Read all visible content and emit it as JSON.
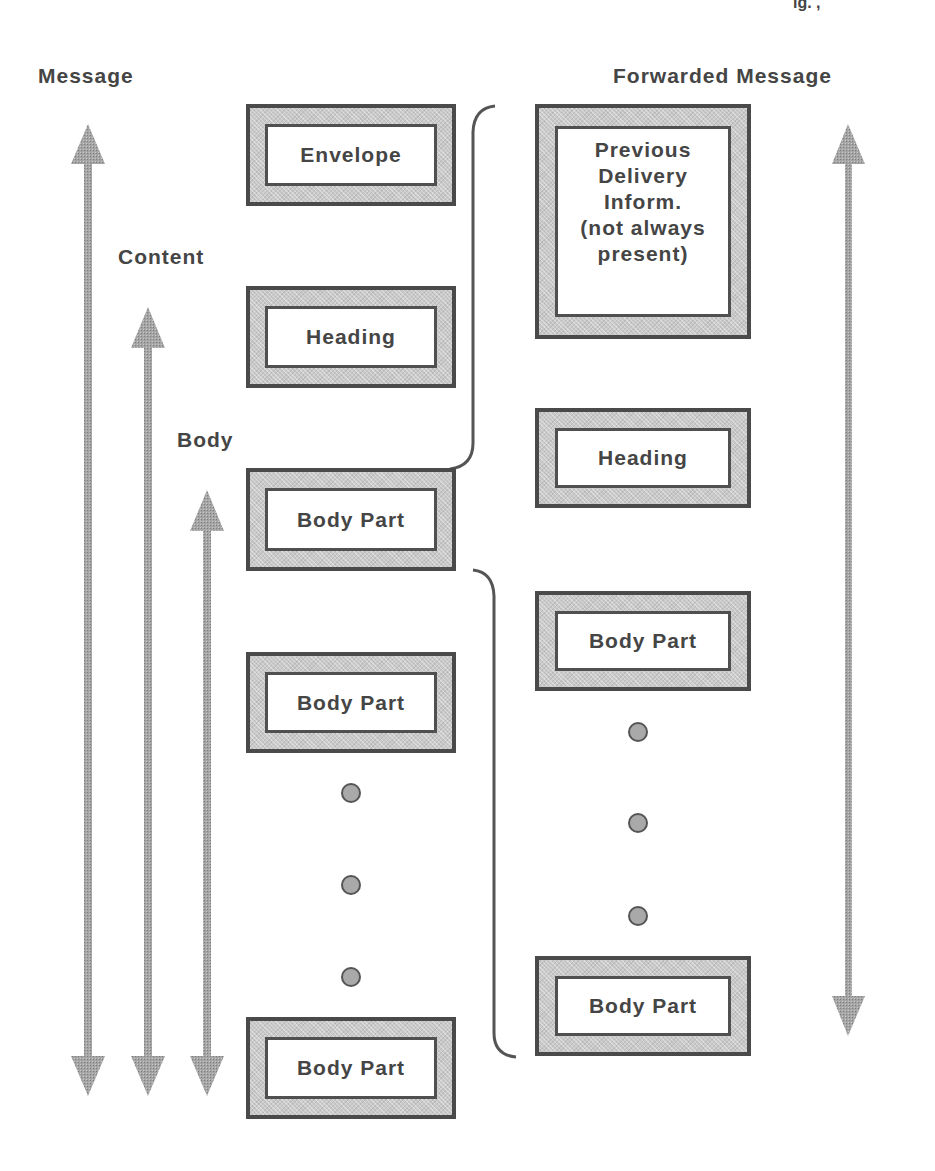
{
  "figure": {
    "top_fragment": "ig. ,",
    "left_labels": {
      "message": "Message",
      "content": "Content",
      "body": "Body"
    },
    "right_label": "Forwarded Message",
    "left_column": {
      "boxes": [
        {
          "id": "envelope",
          "label": "Envelope"
        },
        {
          "id": "heading",
          "label": "Heading"
        },
        {
          "id": "body-part-1",
          "label": "Body Part"
        },
        {
          "id": "body-part-2",
          "label": "Body Part"
        },
        {
          "id": "body-part-last",
          "label": "Body Part"
        }
      ],
      "ellipsis_dots": 3
    },
    "right_column": {
      "boxes": [
        {
          "id": "previous-delivery",
          "label": "Previous\nDelivery\nInform.\n(not always\npresent)"
        },
        {
          "id": "fwd-heading",
          "label": "Heading"
        },
        {
          "id": "fwd-body-part-1",
          "label": "Body Part"
        },
        {
          "id": "fwd-body-part-last",
          "label": "Body Part"
        }
      ],
      "ellipsis_dots": 3
    },
    "arrows": [
      {
        "id": "message-span",
        "label_ref": "Message",
        "direction": "double-vertical"
      },
      {
        "id": "content-span",
        "label_ref": "Content",
        "direction": "double-vertical"
      },
      {
        "id": "body-span",
        "label_ref": "Body",
        "direction": "double-vertical"
      },
      {
        "id": "forwarded-message-span",
        "label_ref": "Forwarded Message",
        "direction": "double-vertical"
      }
    ],
    "braces": [
      {
        "id": "brace-upper",
        "groups": "Envelope + Heading -> Previous Delivery Inform."
      },
      {
        "id": "brace-lower",
        "groups": "Body Part -> Forwarded Message"
      }
    ],
    "colors": {
      "box_border": "#4a4a4a",
      "box_fill": "#c9c9c9",
      "arrow_fill": "#9a9a9a",
      "text": "#454545"
    }
  }
}
